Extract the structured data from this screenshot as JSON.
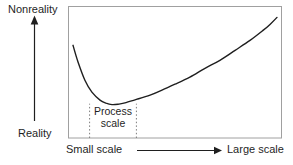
{
  "figure": {
    "background": "#ffffff",
    "ink_color": "#1f1f1f",
    "box_border_color": "#a0a0a0",
    "dotted_line_color": "#7d7d7d"
  },
  "chart_data": {
    "type": "line",
    "title": "",
    "ylabel_top": "Nonreality",
    "ylabel_bottom": "Reality",
    "xlabel_left": "Small scale",
    "xlabel_right": "Large scale",
    "axis_style": "qualitative axes with arrowheads, no tick values; point coordinates are normalized 0-1 inside the plot box (y=1 is Nonreality end, y=0 is Reality end)",
    "xlim": [
      0,
      1
    ],
    "ylim": [
      0,
      1
    ],
    "grid": false,
    "legend": "none",
    "series": [
      {
        "name": "nonreality vs model scale",
        "points": [
          [
            0.021,
            0.705
          ],
          [
            0.045,
            0.576
          ],
          [
            0.077,
            0.439
          ],
          [
            0.11,
            0.348
          ],
          [
            0.148,
            0.288
          ],
          [
            0.176,
            0.265
          ],
          [
            0.204,
            0.254
          ],
          [
            0.237,
            0.258
          ],
          [
            0.27,
            0.269
          ],
          [
            0.322,
            0.295
          ],
          [
            0.383,
            0.326
          ],
          [
            0.439,
            0.364
          ],
          [
            0.5,
            0.409
          ],
          [
            0.57,
            0.462
          ],
          [
            0.641,
            0.53
          ],
          [
            0.711,
            0.591
          ],
          [
            0.782,
            0.667
          ],
          [
            0.852,
            0.742
          ],
          [
            0.913,
            0.818
          ],
          [
            0.946,
            0.864
          ],
          [
            0.979,
            0.917
          ]
        ]
      }
    ],
    "annotations": [
      {
        "label": "Process scale",
        "x_start": 0.099,
        "x_end": 0.319,
        "line_top": 0.261,
        "style": "two vertical dotted lines rising from the x-axis, bracketing the curve minimum"
      }
    ]
  }
}
